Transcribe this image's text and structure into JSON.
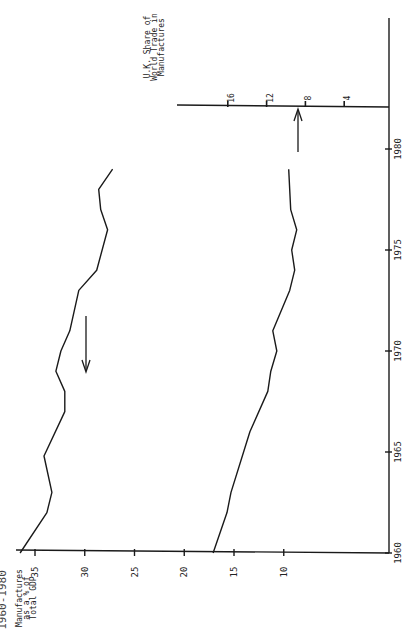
{
  "chart_data": {
    "type": "line",
    "orientation": "rotated-90-ccw",
    "title": "1960-1980",
    "x": [
      1960,
      1961,
      1962,
      1963,
      1964,
      1965,
      1966,
      1967,
      1968,
      1969,
      1970,
      1971,
      1972,
      1973,
      1974,
      1975,
      1976,
      1977,
      1978,
      1979
    ],
    "xlabel": "",
    "x_ticks": [
      "1960",
      "1965",
      "1970",
      "1975",
      "1980"
    ],
    "xlim": [
      1960,
      1981
    ],
    "series": [
      {
        "name": "Manufactures as a % of Total GDP",
        "axis": "primary",
        "points": [
          [
            1960,
            36.5
          ],
          [
            1962,
            33.8
          ],
          [
            1963,
            33.3
          ],
          [
            1964.8,
            34.1
          ],
          [
            1967,
            32.0
          ],
          [
            1968,
            32.0
          ],
          [
            1969,
            32.9
          ],
          [
            1970,
            32.4
          ],
          [
            1971,
            31.5
          ],
          [
            1973,
            30.6
          ],
          [
            1974,
            28.8
          ],
          [
            1976,
            27.7
          ],
          [
            1977,
            28.4
          ],
          [
            1978,
            28.6
          ],
          [
            1979,
            27.2
          ]
        ],
        "trend_arrow": "down"
      },
      {
        "name": "U.K. Share of World Trade in Manufactures",
        "axis": "primary-scale",
        "points": [
          [
            1960,
            17.1
          ],
          [
            1962,
            15.7
          ],
          [
            1963,
            15.3
          ],
          [
            1966,
            13.4
          ],
          [
            1968,
            11.6
          ],
          [
            1969,
            11.3
          ],
          [
            1970,
            10.7
          ],
          [
            1971,
            11.1
          ],
          [
            1973,
            9.4
          ],
          [
            1974,
            8.9
          ],
          [
            1975,
            9.2
          ],
          [
            1976,
            8.7
          ],
          [
            1977,
            9.3
          ],
          [
            1979,
            9.5
          ]
        ],
        "trend_arrow": "up"
      }
    ],
    "y_axes": [
      {
        "label_lines": [
          "Manufactures",
          "as a % of",
          "Total GDP"
        ],
        "ticks": [
          "35",
          "30",
          "25",
          "20",
          "15",
          "10"
        ],
        "tick_values": [
          35,
          30,
          25,
          20,
          15,
          10
        ]
      },
      {
        "label_lines": [
          "U.K. Share of",
          "World Trade in",
          "Manufactures"
        ],
        "ticks": [
          "16",
          "12",
          "8",
          "4"
        ],
        "tick_values": [
          16,
          12,
          8,
          4
        ]
      }
    ],
    "grid": false,
    "legend": "none"
  },
  "labels": {
    "title": "1960-1980",
    "gdp_axis_title": [
      "Manufactures",
      "as a % of",
      "Total GDP"
    ],
    "share_axis_title": [
      "U.K. Share of",
      "World Trade in",
      "Manufactures"
    ]
  }
}
